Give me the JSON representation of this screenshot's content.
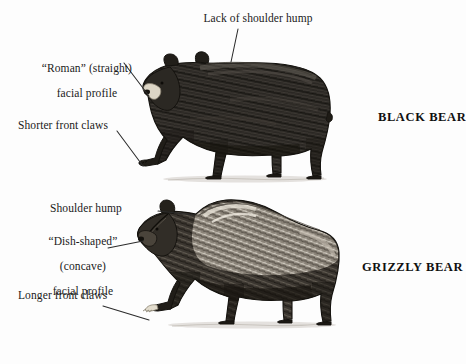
{
  "figure": {
    "background_color": "#fdfdfd",
    "ink_color": "#1a1a1a"
  },
  "black_bear": {
    "species_label": "BLACK BEAR",
    "annotations": {
      "hump": "Lack of shoulder hump",
      "profile_line1": "“Roman” (straight)",
      "profile_line2": "facial profile",
      "claws": "Shorter front claws"
    }
  },
  "grizzly_bear": {
    "species_label": "GRIZZLY BEAR",
    "annotations": {
      "hump": "Shoulder hump",
      "profile_line1": "“Dish-shaped”",
      "profile_line2": "(concave)",
      "profile_line3": "facial profile",
      "claws": "Longer front claws"
    }
  }
}
